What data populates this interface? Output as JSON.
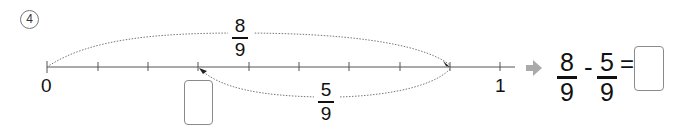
{
  "problem": {
    "number": "4",
    "number_symbol": "④"
  },
  "number_line": {
    "start_label": "0",
    "end_label": "1",
    "divisions": 9,
    "upper_arc": {
      "numerator": "8",
      "denominator": "9",
      "from": 0,
      "to": 8
    },
    "lower_arc": {
      "numerator": "5",
      "denominator": "9",
      "from": 8,
      "to": 3
    },
    "answer_box_under_tick": 3
  },
  "equation": {
    "arrow_icon": "right-arrow",
    "left": {
      "numerator": "8",
      "denominator": "9"
    },
    "operator": "-",
    "right": {
      "numerator": "5",
      "denominator": "9"
    },
    "equals": "=",
    "answer": ""
  },
  "colors": {
    "line": "#555555",
    "arc": "#777777",
    "arrow": "#aaaaaa",
    "box_border": "#8a8a8a"
  }
}
